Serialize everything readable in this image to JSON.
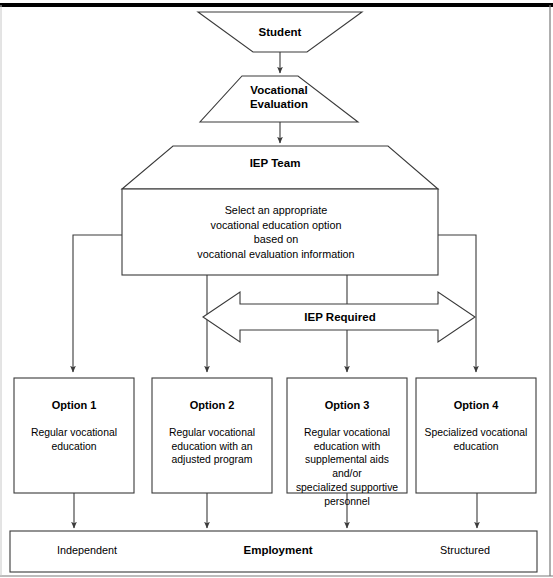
{
  "diagram": {
    "line_color": "#3a3a3a",
    "top_rule_color": "#000000",
    "fill_color": "#ffffff"
  },
  "nodes": {
    "student": {
      "label": "Student",
      "shape": "inverted-trapezoid"
    },
    "vocational_evaluation": {
      "label": "Vocational\nEvaluation",
      "shape": "trapezoid"
    },
    "iep_team": {
      "label": "IEP Team",
      "shape": "trapezoid",
      "body": "Select an appropriate\nvocational education option\nbased on\nvocational evaluation information"
    },
    "iep_required": {
      "label": "IEP Required",
      "shape": "double-headed-arrow"
    }
  },
  "options": [
    {
      "title": "Option 1",
      "body": "Regular vocational\neducation"
    },
    {
      "title": "Option 2",
      "body": "Regular vocational\neducation with an\nadjusted program"
    },
    {
      "title": "Option 3",
      "body": "Regular vocational\neducation with\nsupplemental aids\nand/or\nspecialized supportive\npersonnel"
    },
    {
      "title": "Option 4",
      "body": "Specialized vocational\neducation"
    }
  ],
  "outcome_bar": {
    "left_label": "Independent",
    "center_label": "Employment",
    "right_label": "Structured"
  }
}
